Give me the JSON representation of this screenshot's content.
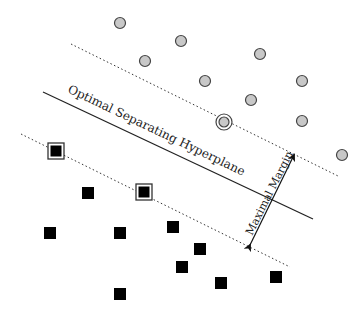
{
  "diagram": {
    "labels": {
      "hyperplane": "Optimal Separating Hyperplane",
      "margin": "Maximal Margin"
    },
    "colors": {
      "circle_fill": "#c8c8c8",
      "circle_stroke": "#444444",
      "square_fill": "#000000",
      "line": "#222222"
    },
    "hyperplane": {
      "x1": 43,
      "y1": 92,
      "x2": 313,
      "y2": 219
    },
    "upper_margin": {
      "x1": 71,
      "y1": 44,
      "x2": 338,
      "y2": 176
    },
    "lower_margin": {
      "x1": 21,
      "y1": 134,
      "x2": 290,
      "y2": 267
    },
    "margin_arrow": {
      "x1": 250,
      "y1": 245,
      "x2": 294,
      "y2": 155
    },
    "circles": [
      {
        "x": 120,
        "y": 23
      },
      {
        "x": 181,
        "y": 41
      },
      {
        "x": 145,
        "y": 61
      },
      {
        "x": 205,
        "y": 81
      },
      {
        "x": 260,
        "y": 54
      },
      {
        "x": 302,
        "y": 81
      },
      {
        "x": 251,
        "y": 100
      },
      {
        "x": 302,
        "y": 121
      },
      {
        "x": 342,
        "y": 155
      }
    ],
    "support_circles": [
      {
        "x": 224,
        "y": 122
      }
    ],
    "squares": [
      {
        "x": 88,
        "y": 193
      },
      {
        "x": 50,
        "y": 233
      },
      {
        "x": 120,
        "y": 233
      },
      {
        "x": 173,
        "y": 227
      },
      {
        "x": 200,
        "y": 249
      },
      {
        "x": 182,
        "y": 267
      },
      {
        "x": 221,
        "y": 283
      },
      {
        "x": 120,
        "y": 294
      },
      {
        "x": 276,
        "y": 277
      }
    ],
    "support_squares": [
      {
        "x": 56,
        "y": 151
      },
      {
        "x": 144,
        "y": 192
      }
    ]
  }
}
